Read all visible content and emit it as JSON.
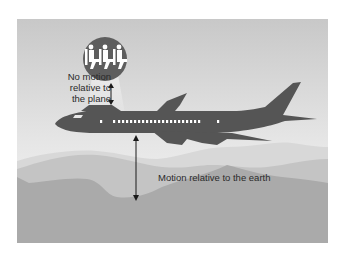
{
  "diagram": {
    "labels": {
      "plane_relative": [
        "No motion",
        "relative to",
        "the plane"
      ],
      "earth_relative": "Motion relative to the earth"
    },
    "colors": {
      "sky_top": "#c9c9c9",
      "sky_bottom": "#f6f6f6",
      "plane": "#555555",
      "inset_circle": "#5e5e5e",
      "mountain_far": "#d6d6d6",
      "mountain_mid": "#c3c3c3",
      "mountain_near": "#a9a9a9",
      "text": "#2a2a2a"
    },
    "elements": [
      "airplane-silhouette",
      "passenger-inset-circle",
      "double-arrow-plane",
      "double-arrow-earth",
      "mountain-layers"
    ]
  }
}
